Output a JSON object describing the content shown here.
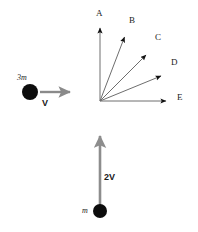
{
  "figure": {
    "title_visible": false,
    "background_color": "#ffffff",
    "ball_color": "#0d0d0d",
    "arrow_line_color": "#6e6e6e",
    "arrow_head_color": "#111111",
    "thick_arrow_color": "#8a8a8a",
    "label_color": "#1a1a1a"
  },
  "incoming": {
    "mass_label": "3m",
    "velocity_label": "V",
    "ball": {
      "cx": 30,
      "cy": 92,
      "r": 8
    },
    "arrow": {
      "x1": 40,
      "y1": 92,
      "x2": 74,
      "y2": 92
    }
  },
  "second_particle": {
    "mass_label": "m",
    "velocity_label": "2V",
    "ball": {
      "cx": 100,
      "cy": 211,
      "r": 7
    },
    "arrow": {
      "x1": 100,
      "y1": 208,
      "x2": 100,
      "y2": 133
    }
  },
  "direction_fan": {
    "origin": {
      "x": 100,
      "y": 101
    },
    "options": [
      {
        "id": "A",
        "label": "A",
        "angle_deg": 90,
        "tip": {
          "x": 100,
          "y": 24
        },
        "label_pos": {
          "x": 96,
          "y": 9
        }
      },
      {
        "id": "B",
        "label": "B",
        "angle_deg": 68,
        "tip": {
          "x": 127,
          "y": 33
        },
        "label_pos": {
          "x": 129,
          "y": 16
        }
      },
      {
        "id": "C",
        "label": "C",
        "angle_deg": 46,
        "tip": {
          "x": 150,
          "y": 51
        },
        "label_pos": {
          "x": 155,
          "y": 33
        }
      },
      {
        "id": "D",
        "label": "D",
        "angle_deg": 25,
        "tip": {
          "x": 166,
          "y": 73
        },
        "label_pos": {
          "x": 171,
          "y": 58
        }
      },
      {
        "id": "E",
        "label": "E",
        "angle_deg": 0,
        "tip": {
          "x": 171,
          "y": 101
        },
        "label_pos": {
          "x": 177,
          "y": 93
        }
      }
    ]
  }
}
